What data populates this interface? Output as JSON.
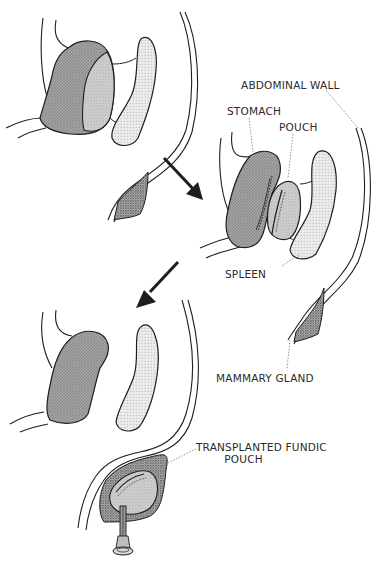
{
  "figure": {
    "type": "anatomical-diagram",
    "colors": {
      "outline": "#1e1e1e",
      "stomach_fill": "#9a9a9a",
      "pouch_fill": "#c4c4c4",
      "spleen_fill": "#e2e2e2",
      "gland_fill": "#8c8c8c",
      "leader_line": "#777777",
      "background": "#ffffff"
    },
    "panels": [
      {
        "id": "panel-1",
        "stage": "original",
        "position": "top-left",
        "structures": [
          "stomach",
          "fundus",
          "spleen",
          "abdominal-wall",
          "mammary-gland"
        ]
      },
      {
        "id": "panel-2",
        "stage": "pouch-separated",
        "position": "middle-right",
        "structures": [
          "stomach",
          "pouch",
          "spleen",
          "abdominal-wall",
          "mammary-gland"
        ]
      },
      {
        "id": "panel-3",
        "stage": "pouch-transplanted",
        "position": "bottom-left",
        "structures": [
          "stomach",
          "spleen",
          "abdominal-wall",
          "transplanted-fundic-pouch",
          "cannula"
        ]
      }
    ],
    "arrows": [
      {
        "from": "panel-1",
        "to": "panel-2",
        "direction": "down-right"
      },
      {
        "from": "panel-2",
        "to": "panel-3",
        "direction": "down-left"
      }
    ]
  },
  "labels": {
    "abdominal_wall": "ABDOMINAL WALL",
    "stomach": "STOMACH",
    "pouch": "POUCH",
    "spleen": "SPLEEN",
    "mammary_gland": "MAMMARY GLAND",
    "transplanted_fundic_pouch": "TRANSPLANTED FUNDIC\n        POUCH"
  }
}
